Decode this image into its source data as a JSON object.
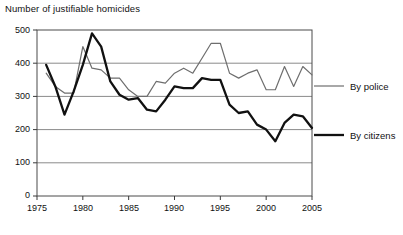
{
  "chart_data": {
    "type": "line",
    "title": "Number of justifiable homicides",
    "xlabel": "",
    "ylabel": "",
    "xlim": [
      1975,
      2005
    ],
    "ylim": [
      0,
      500
    ],
    "xticks": [
      1975,
      1980,
      1985,
      1990,
      1995,
      2000,
      2005
    ],
    "yticks": [
      0,
      100,
      200,
      300,
      400,
      500
    ],
    "grid": "horizontal",
    "legend_position": "right",
    "x": [
      1976,
      1977,
      1978,
      1979,
      1980,
      1981,
      1982,
      1983,
      1984,
      1985,
      1986,
      1987,
      1988,
      1989,
      1990,
      1991,
      1992,
      1993,
      1994,
      1995,
      1996,
      1997,
      1998,
      1999,
      2000,
      2001,
      2002,
      2003,
      2004,
      2005
    ],
    "series": [
      {
        "name": "By police",
        "color": "#6e6e6e",
        "width": 1.2,
        "values": [
          370,
          330,
          310,
          310,
          450,
          385,
          380,
          355,
          355,
          320,
          300,
          300,
          345,
          340,
          370,
          385,
          370,
          415,
          460,
          460,
          370,
          355,
          370,
          380,
          320,
          320,
          390,
          330,
          390,
          365
        ]
      },
      {
        "name": "By citizens",
        "color": "#111111",
        "width": 2.3,
        "values": [
          395,
          330,
          245,
          315,
          395,
          490,
          450,
          345,
          305,
          290,
          295,
          260,
          255,
          290,
          330,
          325,
          325,
          355,
          350,
          350,
          275,
          250,
          255,
          215,
          200,
          165,
          220,
          245,
          240,
          205
        ]
      }
    ]
  },
  "legend": {
    "items": [
      {
        "label": "By police"
      },
      {
        "label": "By citizens"
      }
    ]
  },
  "axis": {
    "y_labels": [
      "500",
      "400",
      "300",
      "200",
      "100",
      "0"
    ],
    "x_labels": [
      "1975",
      "1980",
      "1985",
      "1990",
      "1995",
      "2000",
      "2005"
    ]
  }
}
